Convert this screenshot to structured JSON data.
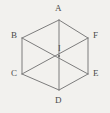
{
  "figure": {
    "kind": "geometry-diagram",
    "shape": "regular-hexagon",
    "background_color": "#f2f1ee",
    "line_color": "#7d7d7d",
    "label_color": "#4a4a4a"
  },
  "labels": {
    "a": "A",
    "b": "B",
    "c": "C",
    "d": "D",
    "e": "E",
    "f": "F",
    "center": "I"
  },
  "vertices": [
    {
      "name": "A",
      "x": 59,
      "y": 20
    },
    {
      "name": "B",
      "x": 22,
      "y": 38
    },
    {
      "name": "C",
      "x": 22,
      "y": 74
    },
    {
      "name": "D",
      "x": 59,
      "y": 90
    },
    {
      "name": "E",
      "x": 88,
      "y": 74
    },
    {
      "name": "F",
      "x": 88,
      "y": 38
    }
  ],
  "center_point": {
    "name": "I",
    "x": 59,
    "y": 56
  },
  "edges": [
    {
      "from": "A",
      "to": "B"
    },
    {
      "from": "B",
      "to": "C"
    },
    {
      "from": "C",
      "to": "D"
    },
    {
      "from": "D",
      "to": "E"
    },
    {
      "from": "E",
      "to": "F"
    },
    {
      "from": "F",
      "to": "A"
    }
  ],
  "diagonals": [
    {
      "from": "A",
      "to": "D"
    },
    {
      "from": "B",
      "to": "E"
    },
    {
      "from": "C",
      "to": "F"
    }
  ]
}
